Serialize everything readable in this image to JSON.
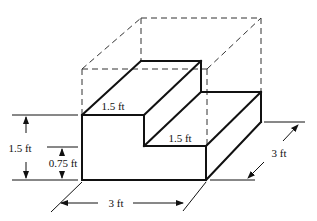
{
  "figure": {
    "labels": {
      "top_step_depth": "1.5 ft",
      "lower_step_depth": "1.5 ft",
      "total_height": "1.5 ft",
      "lower_step_height": "0.75 ft",
      "width": "3 ft",
      "length": "3 ft"
    },
    "colors": {
      "line": "#111111",
      "dashed": "#333333",
      "background": "#ffffff"
    }
  }
}
